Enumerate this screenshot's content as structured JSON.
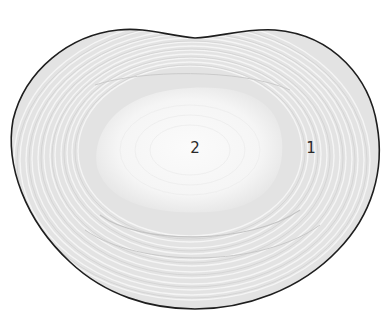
{
  "diagram": {
    "colors": {
      "background": "#ffffff",
      "outline": "#1e1e1e",
      "annulus_fill": "#e2e2e2",
      "ring_line": "#f4f4f4",
      "ring_dark": "#cfcfcf",
      "nucleus_fill": "#f7f7f7",
      "label_color": "#2a2a2a"
    },
    "labels": [
      {
        "id": "1",
        "text": "1",
        "x": 311,
        "y": 148,
        "region": "annulus fibrosus (outer rings)"
      },
      {
        "id": "2",
        "text": "2",
        "x": 195,
        "y": 148,
        "region": "nucleus pulposus (inner core)"
      }
    ]
  }
}
